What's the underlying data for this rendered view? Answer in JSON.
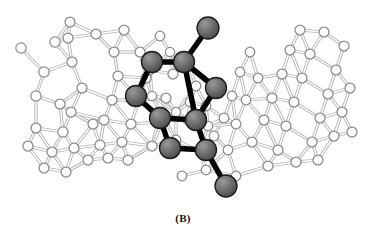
{
  "figure": {
    "panel_label": "(B)",
    "background_color": "#ffffff",
    "width": 366,
    "height": 237
  },
  "legend": {
    "guest_atom_color": "#6e6e6e",
    "guest_atom_stroke": "#1a1a1a",
    "guest_bond_color": "#000000",
    "host_atom_fill": "#ffffff",
    "host_atom_stroke": "#8c8c8c",
    "host_bond_color": "#b4b4b4"
  },
  "chart_data": {
    "type": "scatter",
    "title": "(B)",
    "xlabel": "",
    "ylabel": "",
    "xlim": [
      0,
      366
    ],
    "ylim": [
      0,
      237
    ],
    "grid": false,
    "legend_position": "none",
    "series": [
      {
        "name": "host-framework-atoms",
        "style": "open-circle",
        "fill": "#ffffff",
        "stroke": "#8c8c8c",
        "points": [
          [
            21,
            48,
            5.2
          ],
          [
            55,
            42,
            5.2
          ],
          [
            68,
            38,
            5.0
          ],
          [
            72,
            62,
            5.0
          ],
          [
            44,
            72,
            5.2
          ],
          [
            36,
            96,
            5.2
          ],
          [
            60,
            104,
            5.0
          ],
          [
            82,
            88,
            5.0
          ],
          [
            71,
            112,
            5.0
          ],
          [
            93,
            124,
            5.0
          ],
          [
            63,
            132,
            5.2
          ],
          [
            36,
            128,
            5.0
          ],
          [
            28,
            146,
            5.0
          ],
          [
            52,
            152,
            5.0
          ],
          [
            74,
            148,
            5.0
          ],
          [
            88,
            160,
            5.0
          ],
          [
            66,
            172,
            5.0
          ],
          [
            44,
            168,
            5.0
          ],
          [
            100,
            145,
            5.0
          ],
          [
            104,
            120,
            5.0
          ],
          [
            112,
            100,
            5.0
          ],
          [
            118,
            76,
            5.0
          ],
          [
            114,
            52,
            5.0
          ],
          [
            70,
            22,
            5.0
          ],
          [
            96,
            34,
            5.0
          ],
          [
            124,
            30,
            5.0
          ],
          [
            140,
            52,
            5.0
          ],
          [
            146,
            78,
            5.0
          ],
          [
            139,
            100,
            5.0
          ],
          [
            131,
            124,
            5.0
          ],
          [
            122,
            142,
            5.0
          ],
          [
            108,
            158,
            5.0
          ],
          [
            128,
            160,
            5.0
          ],
          [
            152,
            146,
            5.0
          ],
          [
            158,
            122,
            5.0
          ],
          [
            166,
            98,
            5.0
          ],
          [
            173,
            74,
            5.0
          ],
          [
            160,
            36,
            4.8
          ],
          [
            186,
            58,
            4.8
          ],
          [
            196,
            86,
            4.8
          ],
          [
            206,
            106,
            4.8
          ],
          [
            188,
            120,
            4.8
          ],
          [
            176,
            140,
            4.8
          ],
          [
            200,
            152,
            4.8
          ],
          [
            214,
            136,
            4.8
          ],
          [
            224,
            118,
            4.8
          ],
          [
            232,
            96,
            4.8
          ],
          [
            240,
            72,
            4.8
          ],
          [
            250,
            52,
            4.8
          ],
          [
            258,
            78,
            4.8
          ],
          [
            246,
            100,
            4.8
          ],
          [
            236,
            124,
            4.8
          ],
          [
            228,
            150,
            4.8
          ],
          [
            252,
            142,
            5.0
          ],
          [
            264,
            120,
            5.0
          ],
          [
            272,
            98,
            5.0
          ],
          [
            282,
            74,
            5.0
          ],
          [
            290,
            50,
            5.0
          ],
          [
            300,
            30,
            5.0
          ],
          [
            310,
            54,
            5.0
          ],
          [
            302,
            78,
            5.0
          ],
          [
            294,
            102,
            5.0
          ],
          [
            286,
            126,
            5.0
          ],
          [
            278,
            150,
            5.0
          ],
          [
            268,
            166,
            5.0
          ],
          [
            296,
            162,
            5.0
          ],
          [
            312,
            142,
            5.0
          ],
          [
            320,
            118,
            5.0
          ],
          [
            328,
            94,
            5.0
          ],
          [
            336,
            70,
            5.0
          ],
          [
            344,
            46,
            5.0
          ],
          [
            324,
            32,
            5.0
          ],
          [
            350,
            88,
            5.0
          ],
          [
            342,
            112,
            5.0
          ],
          [
            334,
            136,
            5.0
          ],
          [
            318,
            160,
            5.0
          ],
          [
            352,
            132,
            5.0
          ],
          [
            206,
            170,
            4.8
          ],
          [
            182,
            176,
            4.8
          ],
          [
            236,
            176,
            4.8
          ],
          [
            152,
            96,
            4.6
          ],
          [
            164,
            118,
            4.6
          ],
          [
            176,
            112,
            4.6
          ],
          [
            190,
            102,
            4.6
          ],
          [
            208,
            126,
            4.6
          ],
          [
            150,
            70,
            4.6
          ],
          [
            170,
            52,
            4.6
          ]
        ]
      },
      {
        "name": "guest-molecule-atoms",
        "style": "shaded-sphere",
        "fill": "#6e6e6e",
        "stroke": "#1a1a1a",
        "points": [
          [
            208,
            28,
            11.0
          ],
          [
            184,
            62,
            10.5
          ],
          [
            152,
            62,
            10.5
          ],
          [
            136,
            96,
            10.5
          ],
          [
            160,
            118,
            10.5
          ],
          [
            196,
            120,
            10.5
          ],
          [
            216,
            88,
            10.5
          ],
          [
            206,
            150,
            10.5
          ],
          [
            170,
            148,
            10.5
          ],
          [
            226,
            186,
            11.0
          ]
        ]
      }
    ],
    "bonds": {
      "guest": [
        [
          208,
          28,
          184,
          62
        ],
        [
          184,
          62,
          152,
          62
        ],
        [
          152,
          62,
          136,
          96
        ],
        [
          136,
          96,
          160,
          118
        ],
        [
          160,
          118,
          196,
          120
        ],
        [
          196,
          120,
          184,
          62
        ],
        [
          184,
          62,
          216,
          88
        ],
        [
          216,
          88,
          196,
          120
        ],
        [
          196,
          120,
          206,
          150
        ],
        [
          206,
          150,
          170,
          148
        ],
        [
          170,
          148,
          160,
          118
        ],
        [
          206,
          150,
          226,
          186
        ]
      ]
    },
    "annotations": [
      {
        "text": "(B)",
        "x": 183,
        "y": 222,
        "style": "bold-serif"
      }
    ]
  }
}
